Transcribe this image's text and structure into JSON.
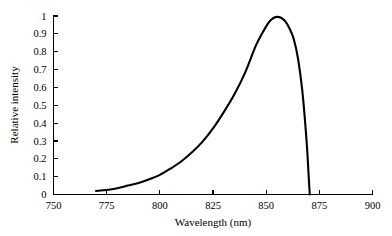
{
  "chart_data": {
    "type": "line",
    "title": "",
    "subtitle": "",
    "xlabel": "Wavelength (nm)",
    "ylabel": "Relative intensity",
    "xlim": [
      750,
      900
    ],
    "ylim": [
      0,
      1
    ],
    "xticks": [
      750,
      775,
      800,
      825,
      850,
      875,
      900
    ],
    "xtick_labels": [
      "750",
      "775",
      "800",
      "825",
      "850",
      "875",
      "900"
    ],
    "yticks": [
      0,
      0.1,
      0.2,
      0.3,
      0.4,
      0.5,
      0.6,
      0.7,
      0.8,
      0.9,
      1
    ],
    "ytick_labels": [
      "0",
      "0.1",
      "0.2",
      "0.3",
      "0.4",
      "0.5",
      "0.6",
      "0.7",
      "0.8",
      "0.9",
      "1"
    ],
    "grid": false,
    "legend": null,
    "legend_position": "none",
    "annotations": [],
    "series": [
      {
        "name": "Relative intensity",
        "color": "#000000",
        "x": [
          770,
          775,
          780,
          785,
          790,
          795,
          800,
          805,
          810,
          815,
          820,
          825,
          830,
          835,
          840,
          845,
          848,
          851,
          853,
          855,
          857,
          859,
          861,
          863,
          865,
          867,
          869,
          870,
          870.5
        ],
        "y": [
          0.02,
          0.025,
          0.035,
          0.05,
          0.065,
          0.085,
          0.11,
          0.145,
          0.185,
          0.235,
          0.295,
          0.37,
          0.46,
          0.56,
          0.68,
          0.83,
          0.9,
          0.96,
          0.985,
          0.995,
          0.99,
          0.97,
          0.93,
          0.87,
          0.76,
          0.58,
          0.3,
          0.1,
          0.0
        ]
      }
    ],
    "peak": {
      "x": 855,
      "y": 1.0
    },
    "cutoff": {
      "x": 870.5,
      "y": 0.0
    }
  },
  "axes": {
    "x_title": "Wavelength (nm)",
    "y_title": "Relative intensity"
  }
}
